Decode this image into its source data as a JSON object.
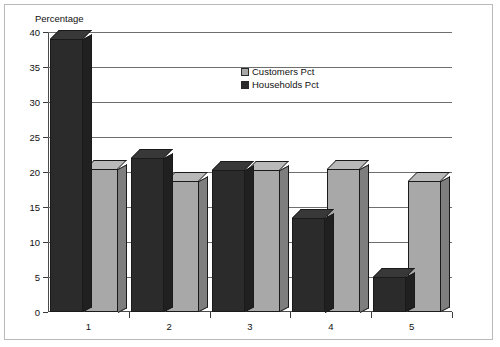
{
  "chart_data": {
    "type": "bar",
    "title": "",
    "ylabel": "Percentage",
    "xlabel": "",
    "categories": [
      "1",
      "2",
      "3",
      "4",
      "5"
    ],
    "series": [
      {
        "name": "Households Pct",
        "color": "#2b2b2b",
        "values": [
          39.0,
          22.0,
          20.3,
          13.5,
          5.0
        ]
      },
      {
        "name": "Customers Pct",
        "color": "#a8a8a8",
        "values": [
          20.5,
          18.7,
          20.3,
          20.5,
          18.7
        ]
      }
    ],
    "ylim": [
      0,
      40
    ],
    "yticks": [
      0,
      5,
      10,
      15,
      20,
      25,
      30,
      35,
      40
    ],
    "ytick_labels": [
      "0",
      "5",
      "10",
      "15",
      "20",
      "25",
      "30",
      "35",
      "40"
    ],
    "grid": true,
    "legend_position": "upper-center",
    "legend_entries": [
      "Customers Pct",
      "Households Pct"
    ]
  }
}
